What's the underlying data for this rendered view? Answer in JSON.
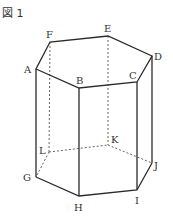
{
  "figure": {
    "label": "図 1",
    "shape": "regular hexagonal prism"
  },
  "vertices": {
    "A": {
      "label": "A",
      "x": 36,
      "y": 69
    },
    "B": {
      "label": "B",
      "x": 79,
      "y": 88
    },
    "C": {
      "label": "C",
      "x": 137,
      "y": 82
    },
    "D": {
      "label": "D",
      "x": 152,
      "y": 56
    },
    "E": {
      "label": "E",
      "x": 108,
      "y": 36
    },
    "F": {
      "label": "F",
      "x": 50,
      "y": 42
    },
    "G": {
      "label": "G",
      "x": 36,
      "y": 177
    },
    "H": {
      "label": "H",
      "x": 79,
      "y": 196
    },
    "I": {
      "label": "I",
      "x": 137,
      "y": 190
    },
    "J": {
      "label": "J",
      "x": 152,
      "y": 163
    },
    "K": {
      "label": "K",
      "x": 108,
      "y": 145
    },
    "L": {
      "label": "L",
      "x": 49,
      "y": 152
    }
  },
  "edges": {
    "solid": [
      "AB",
      "BC",
      "CD",
      "DE",
      "EF",
      "FA",
      "GH",
      "HI",
      "IJ",
      "AG",
      "BH",
      "CI",
      "DJ"
    ],
    "hidden": [
      "JK",
      "KL",
      "LG",
      "FL",
      "EK"
    ]
  }
}
